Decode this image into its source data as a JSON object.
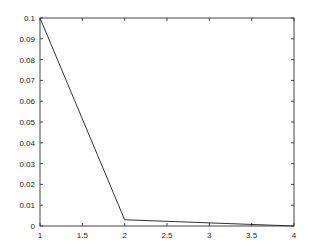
{
  "chart_data": {
    "type": "line",
    "title": "",
    "xlabel": "",
    "ylabel": "",
    "x": [
      1,
      2,
      3,
      4
    ],
    "series": [
      {
        "name": "series1",
        "values": [
          0.1,
          0.003,
          0.0015,
          0.0
        ],
        "color": "#333333"
      }
    ],
    "xlim": [
      1,
      4
    ],
    "ylim": [
      0,
      0.1
    ],
    "xticks": [
      "1",
      "1.5",
      "2",
      "2.5",
      "3",
      "3.5",
      "4"
    ],
    "yticks": [
      "0",
      "0.01",
      "0.02",
      "0.03",
      "0.04",
      "0.05",
      "0.06",
      "0.07",
      "0.08",
      "0.09",
      "0.1"
    ],
    "grid": false,
    "legend": null
  }
}
